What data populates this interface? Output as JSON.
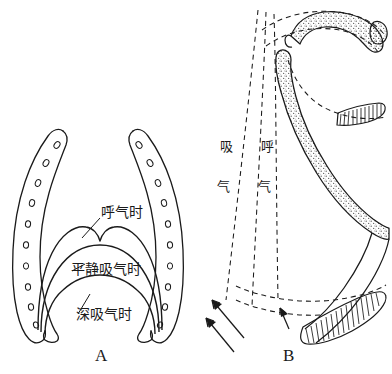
{
  "figure": {
    "background_color": "#ffffff",
    "ink_color": "#1a1a1a",
    "stipple_color": "#5a5a5a",
    "panels": [
      {
        "id": "A",
        "letter": "A",
        "view": "frontal",
        "description": "thoracic cage frontal view with three diaphragm dome outlines"
      },
      {
        "id": "B",
        "letter": "B",
        "view": "lateral",
        "description": "ribs in lateral view with dashed lines showing excursion"
      }
    ]
  },
  "panel_a": {
    "letter": "A",
    "labels": {
      "expiration": "呼气时",
      "quiet_inspiration": "平静吸气时",
      "deep_inspiration": "深吸气时"
    }
  },
  "panel_b": {
    "letter": "B",
    "labels": {
      "inspiration_char1": "吸",
      "inspiration_char2": "气",
      "expiration_char1": "呼",
      "expiration_char2": "气"
    }
  }
}
